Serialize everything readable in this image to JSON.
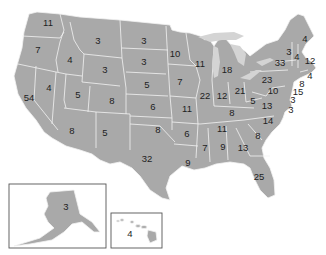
{
  "map": {
    "title": "US Electoral Votes by State",
    "fill_color": "#a9a9a9",
    "border_color": "#f2f2f2",
    "lake_color": "#d4d4d4",
    "label_color": "#1e1e1e"
  },
  "states": [
    {
      "abbr": "WA",
      "votes": "11",
      "x": 48,
      "y": 23
    },
    {
      "abbr": "OR",
      "votes": "7",
      "x": 38,
      "y": 50
    },
    {
      "abbr": "CA",
      "votes": "54",
      "x": 29,
      "y": 98
    },
    {
      "abbr": "NV",
      "votes": "4",
      "x": 49,
      "y": 88
    },
    {
      "abbr": "ID",
      "votes": "4",
      "x": 70,
      "y": 60
    },
    {
      "abbr": "MT",
      "votes": "3",
      "x": 98,
      "y": 41
    },
    {
      "abbr": "WY",
      "votes": "3",
      "x": 105,
      "y": 70
    },
    {
      "abbr": "UT",
      "votes": "5",
      "x": 78,
      "y": 95
    },
    {
      "abbr": "CO",
      "votes": "8",
      "x": 112,
      "y": 101
    },
    {
      "abbr": "AZ",
      "votes": "8",
      "x": 72,
      "y": 131
    },
    {
      "abbr": "NM",
      "votes": "5",
      "x": 105,
      "y": 133
    },
    {
      "abbr": "ND",
      "votes": "3",
      "x": 144,
      "y": 41
    },
    {
      "abbr": "SD",
      "votes": "3",
      "x": 144,
      "y": 62
    },
    {
      "abbr": "NE",
      "votes": "5",
      "x": 147,
      "y": 85
    },
    {
      "abbr": "KS",
      "votes": "6",
      "x": 153,
      "y": 107
    },
    {
      "abbr": "OK",
      "votes": "8",
      "x": 158,
      "y": 130
    },
    {
      "abbr": "TX",
      "votes": "32",
      "x": 147,
      "y": 159
    },
    {
      "abbr": "MN",
      "votes": "10",
      "x": 175,
      "y": 54
    },
    {
      "abbr": "IA",
      "votes": "7",
      "x": 180,
      "y": 82
    },
    {
      "abbr": "MO",
      "votes": "11",
      "x": 187,
      "y": 109
    },
    {
      "abbr": "AR",
      "votes": "6",
      "x": 187,
      "y": 134
    },
    {
      "abbr": "LA",
      "votes": "9",
      "x": 188,
      "y": 163
    },
    {
      "abbr": "WI",
      "votes": "11",
      "x": 200,
      "y": 64
    },
    {
      "abbr": "IL",
      "votes": "22",
      "x": 205,
      "y": 96
    },
    {
      "abbr": "MI",
      "votes": "18",
      "x": 227,
      "y": 70
    },
    {
      "abbr": "IN",
      "votes": "12",
      "x": 222,
      "y": 96
    },
    {
      "abbr": "OH",
      "votes": "21",
      "x": 240,
      "y": 91
    },
    {
      "abbr": "KY",
      "votes": "8",
      "x": 232,
      "y": 113
    },
    {
      "abbr": "TN",
      "votes": "11",
      "x": 222,
      "y": 129
    },
    {
      "abbr": "MS",
      "votes": "7",
      "x": 205,
      "y": 148
    },
    {
      "abbr": "AL",
      "votes": "9",
      "x": 223,
      "y": 147
    },
    {
      "abbr": "GA",
      "votes": "13",
      "x": 243,
      "y": 148
    },
    {
      "abbr": "FL",
      "votes": "25",
      "x": 259,
      "y": 177
    },
    {
      "abbr": "SC",
      "votes": "8",
      "x": 258,
      "y": 136
    },
    {
      "abbr": "NC",
      "votes": "14",
      "x": 268,
      "y": 121
    },
    {
      "abbr": "VA",
      "votes": "13",
      "x": 267,
      "y": 106
    },
    {
      "abbr": "WV",
      "votes": "5",
      "x": 253,
      "y": 101
    },
    {
      "abbr": "PA",
      "votes": "23",
      "x": 267,
      "y": 80
    },
    {
      "abbr": "NY",
      "votes": "33",
      "x": 280,
      "y": 63
    },
    {
      "abbr": "VT",
      "votes": "3",
      "x": 289,
      "y": 52
    },
    {
      "abbr": "NH",
      "votes": "4",
      "x": 297,
      "y": 57
    },
    {
      "abbr": "ME",
      "votes": "4",
      "x": 305,
      "y": 39
    },
    {
      "abbr": "MA",
      "votes": "12",
      "x": 310,
      "y": 61
    },
    {
      "abbr": "RI",
      "votes": "4",
      "x": 310,
      "y": 76
    },
    {
      "abbr": "CT",
      "votes": "8",
      "x": 302,
      "y": 84
    },
    {
      "abbr": "NJ",
      "votes": "15",
      "x": 298,
      "y": 92
    },
    {
      "abbr": "DE",
      "votes": "3",
      "x": 293,
      "y": 100
    },
    {
      "abbr": "MD",
      "votes": "10",
      "x": 273,
      "y": 91
    },
    {
      "abbr": "DC",
      "votes": "3",
      "x": 291,
      "y": 110
    },
    {
      "abbr": "AK",
      "votes": "3",
      "x": 66,
      "y": 207
    },
    {
      "abbr": "HI",
      "votes": "4",
      "x": 130,
      "y": 234
    }
  ]
}
